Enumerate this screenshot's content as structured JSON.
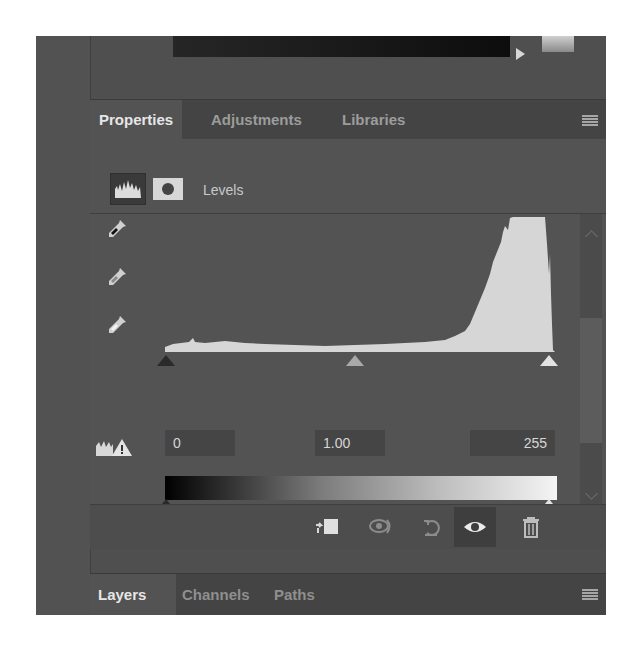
{
  "top_strip": {
    "gradient_bar": "dark-gradient",
    "arrow_icon": "play-arrow-icon"
  },
  "panel_tabs": {
    "items": [
      {
        "label": "Properties",
        "active": true
      },
      {
        "label": "Adjustments",
        "active": false
      },
      {
        "label": "Libraries",
        "active": false
      }
    ],
    "menu_icon": "panel-menu-icon"
  },
  "levels_header": {
    "adjustment_icon": "levels-histogram-icon",
    "mask_icon": "layer-mask-icon",
    "title": "Levels"
  },
  "eyedroppers": [
    {
      "name": "black-point-eyedropper-icon"
    },
    {
      "name": "gray-point-eyedropper-icon"
    },
    {
      "name": "white-point-eyedropper-icon"
    }
  ],
  "histogram": {
    "description": "low flat shadows/midtones, steep rise in highlights, clipped peak near 235-250"
  },
  "input_levels": {
    "black": "0",
    "gamma": "1.00",
    "white": "255",
    "auto_icon": "auto-levels-warning-icon"
  },
  "output_levels": {
    "black": 0,
    "white": 255
  },
  "footer_icons": [
    {
      "name": "clip-to-layer-icon"
    },
    {
      "name": "view-previous-state-icon"
    },
    {
      "name": "reset-icon"
    },
    {
      "name": "visibility-eye-icon"
    },
    {
      "name": "delete-trash-icon"
    }
  ],
  "bottom_tabs": {
    "items": [
      {
        "label": "Layers",
        "active": true
      },
      {
        "label": "Channels",
        "active": false
      },
      {
        "label": "Paths",
        "active": false
      }
    ],
    "menu_icon": "panel-menu-icon"
  },
  "colors": {
    "panel_bg": "#535353",
    "tab_bar_bg": "#444444",
    "text_active": "#e6e6e6",
    "text_inactive": "#9c9c9c",
    "histogram_fill": "#d6d6d6"
  }
}
